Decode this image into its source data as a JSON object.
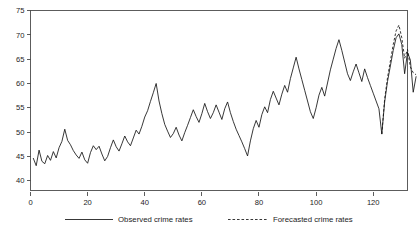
{
  "chart_data": {
    "type": "line",
    "title": "",
    "subtitle": "",
    "xlabel": "",
    "ylabel": "",
    "xlim": [
      0,
      132
    ],
    "ylim": [
      38,
      75
    ],
    "grid": false,
    "legend_position": "bottom",
    "x_ticks": [
      0,
      20,
      40,
      60,
      80,
      100,
      120
    ],
    "x_tick_labels": [
      "0",
      "20",
      "40",
      "60",
      "80",
      "100",
      "120"
    ],
    "y_ticks": [
      40,
      45,
      50,
      55,
      60,
      65,
      70,
      75
    ],
    "y_tick_labels": [
      "40",
      "45",
      "50",
      "55",
      "60",
      "65",
      "70",
      "75"
    ],
    "series": [
      {
        "name": "Observed crime rates",
        "style": "solid",
        "color": "#141414",
        "x_start": 1,
        "values": [
          44.6,
          43.1,
          46.3,
          44.0,
          43.5,
          45.2,
          44.2,
          46.0,
          44.7,
          46.8,
          48.1,
          50.6,
          48.3,
          47.4,
          46.2,
          45.3,
          44.6,
          45.9,
          44.3,
          43.6,
          45.8,
          47.2,
          46.4,
          47.1,
          45.5,
          44.1,
          45.0,
          46.8,
          48.4,
          47.0,
          46.1,
          47.6,
          49.2,
          48.0,
          47.2,
          48.8,
          50.4,
          49.6,
          51.2,
          53.1,
          54.4,
          56.3,
          58.1,
          60.0,
          56.4,
          53.8,
          51.6,
          50.2,
          48.9,
          49.7,
          51.0,
          49.4,
          48.2,
          49.9,
          51.4,
          53.0,
          54.6,
          53.2,
          52.0,
          53.8,
          55.9,
          54.2,
          52.8,
          54.0,
          55.6,
          54.1,
          52.6,
          54.8,
          56.2,
          54.0,
          52.2,
          50.6,
          49.3,
          48.0,
          46.6,
          45.1,
          48.2,
          50.7,
          52.4,
          51.0,
          53.6,
          55.2,
          54.0,
          56.7,
          58.4,
          57.0,
          55.6,
          57.8,
          59.6,
          58.2,
          61.0,
          63.2,
          65.4,
          63.0,
          60.8,
          58.6,
          56.4,
          54.2,
          52.8,
          55.0,
          57.6,
          59.2,
          57.4,
          60.1,
          62.8,
          65.0,
          67.2,
          69.0,
          66.8,
          64.4,
          62.0,
          60.6,
          62.4,
          64.0,
          62.2,
          60.4,
          63.0,
          61.2,
          59.6,
          58.0,
          56.4,
          54.8,
          49.6,
          56.2,
          60.4,
          63.6,
          66.8,
          69.4,
          70.2,
          68.0,
          62.0,
          66.4,
          64.8,
          58.2,
          61.4
        ]
      },
      {
        "name": "Forecasted crime rates",
        "style": "dashed",
        "color": "#141414",
        "x_start": 123,
        "values": [
          49.6,
          56.8,
          61.2,
          64.6,
          68.0,
          70.8,
          72.0,
          69.4,
          65.2,
          67.0,
          63.4,
          62.2,
          61.8
        ]
      }
    ]
  },
  "legend": {
    "entries": [
      {
        "label": "Observed crime rates",
        "style": "solid"
      },
      {
        "label": "Forecasted crime rates",
        "style": "dashed"
      }
    ]
  },
  "axis": {
    "y_labels": [
      "75",
      "70",
      "65",
      "60",
      "55",
      "50",
      "45",
      "40"
    ],
    "x_labels": [
      "0",
      "20",
      "40",
      "60",
      "80",
      "100",
      "120"
    ]
  }
}
